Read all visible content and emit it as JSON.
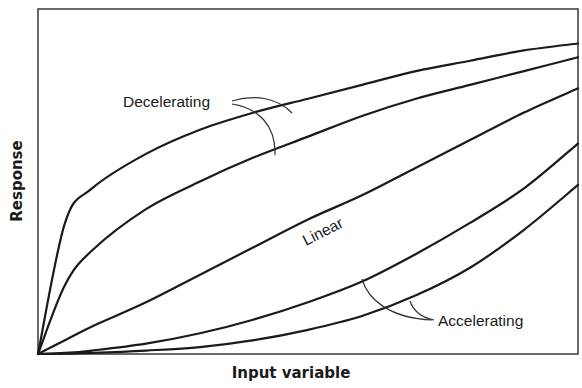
{
  "chart_data": {
    "type": "line",
    "title": "",
    "xlabel": "Input variable",
    "ylabel": "Response",
    "xlim": [
      0,
      1
    ],
    "ylim": [
      0,
      1
    ],
    "grid": false,
    "legend": "none (inline annotations)",
    "ticks": "none",
    "x": [
      0,
      0.05,
      0.1,
      0.2,
      0.3,
      0.4,
      0.5,
      0.6,
      0.7,
      0.8,
      0.9,
      1.0
    ],
    "series": [
      {
        "name": "Decelerating (strong)",
        "group": "Decelerating",
        "values": [
          0,
          0.38,
          0.48,
          0.58,
          0.65,
          0.7,
          0.74,
          0.78,
          0.82,
          0.85,
          0.88,
          0.9
        ]
      },
      {
        "name": "Decelerating (mild)",
        "group": "Decelerating",
        "values": [
          0,
          0.2,
          0.3,
          0.42,
          0.5,
          0.57,
          0.63,
          0.69,
          0.74,
          0.78,
          0.82,
          0.86
        ]
      },
      {
        "name": "Linear",
        "group": "Linear",
        "values": [
          0,
          0.04,
          0.08,
          0.15,
          0.23,
          0.31,
          0.39,
          0.46,
          0.54,
          0.62,
          0.7,
          0.77
        ]
      },
      {
        "name": "Accelerating (mild)",
        "group": "Accelerating",
        "values": [
          0,
          0.003,
          0.01,
          0.03,
          0.06,
          0.1,
          0.15,
          0.21,
          0.29,
          0.38,
          0.48,
          0.61
        ]
      },
      {
        "name": "Accelerating (strong)",
        "group": "Accelerating",
        "values": [
          0,
          0.001,
          0.003,
          0.01,
          0.02,
          0.04,
          0.07,
          0.11,
          0.17,
          0.25,
          0.36,
          0.49
        ]
      }
    ],
    "annotations": [
      {
        "text": "Decelerating",
        "targets": [
          "Decelerating (strong)",
          "Decelerating (mild)"
        ]
      },
      {
        "text": "Linear",
        "target": "Linear",
        "rotation_deg": -27
      },
      {
        "text": "Accelerating",
        "targets": [
          "Accelerating (mild)",
          "Accelerating (strong)"
        ]
      }
    ]
  },
  "labels": {
    "decelerating": "Decelerating",
    "linear": "Linear",
    "accelerating": "Accelerating",
    "x_axis": "Input variable",
    "y_axis": "Response"
  },
  "colors": {
    "line": "#1a1a1a",
    "frame": "#3a3a3a",
    "background": "#ffffff"
  }
}
